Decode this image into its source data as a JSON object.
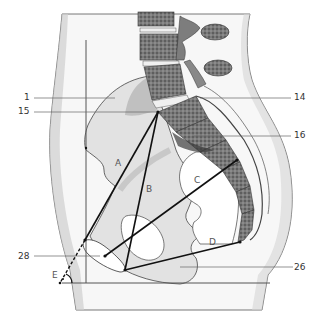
{
  "diagram": {
    "type": "anatomical-sagittal-pelvis",
    "callouts": [
      {
        "id": "1",
        "label": "1",
        "side": "left"
      },
      {
        "id": "15",
        "label": "15",
        "side": "left"
      },
      {
        "id": "14",
        "label": "14",
        "side": "right"
      },
      {
        "id": "16",
        "label": "16",
        "side": "right"
      },
      {
        "id": "28",
        "label": "28",
        "side": "left"
      },
      {
        "id": "26",
        "label": "26",
        "side": "right"
      }
    ],
    "measurement_lines": [
      {
        "id": "A",
        "label": "A"
      },
      {
        "id": "B",
        "label": "B"
      },
      {
        "id": "C",
        "label": "C"
      },
      {
        "id": "D",
        "label": "D"
      },
      {
        "id": "E",
        "label": "E"
      }
    ],
    "colors": {
      "line": "#111111",
      "callout_line": "#666666",
      "body_outline": "#555555",
      "bone_fill": "#dcdcdc",
      "vertebra_fill": "#6e6e6e",
      "background": "#ffffff"
    }
  }
}
